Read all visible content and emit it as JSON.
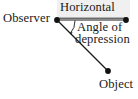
{
  "figure": {
    "kind": "geometry-diagram",
    "topic": "Angle of depression",
    "background_color": "#ffffff",
    "ink_color": "#1a1a1a",
    "shade_color": "#f0f0f0"
  },
  "labels": {
    "observer": "Observer",
    "horizontal": "Horizontal",
    "angle_line1": "Angle of",
    "angle_line2": "depression",
    "object": "Object"
  },
  "icons": {
    "observer_point": "filled-dot-icon",
    "horizon_point": "filled-dot-icon",
    "object_point": "filled-dot-icon",
    "angle_marker": "angle-arc-arrow-icon"
  },
  "geometry": {
    "observer_point": {
      "x": 57,
      "y": 20
    },
    "horizon_point": {
      "x": 126,
      "y": 20
    },
    "object_point": {
      "x": 108,
      "y": 71
    },
    "horizontal_line": {
      "x1": 57,
      "y1": 20,
      "x2": 126,
      "y2": 20
    },
    "line_of_sight": {
      "x1": 57,
      "y1": 20,
      "x2": 108,
      "y2": 71
    },
    "underline_rule": {
      "x1": 58,
      "y1": 18,
      "x2": 128,
      "y2": 18
    },
    "angle_arc": {
      "cx": 57,
      "cy": 20,
      "radius": 14,
      "start_deg": 45,
      "end_deg": 0
    },
    "dot_radius": 2.8,
    "stroke_width": 1.1
  }
}
